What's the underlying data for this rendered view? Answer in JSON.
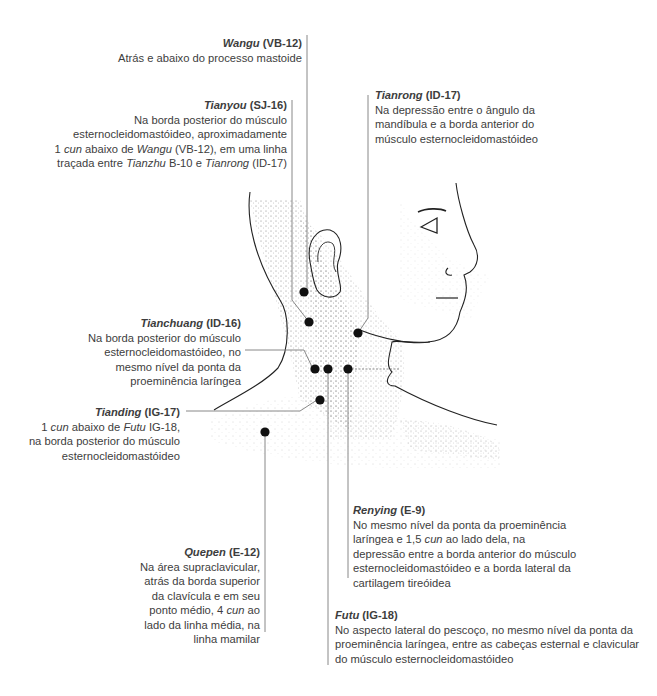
{
  "points": [
    {
      "id": "wangu",
      "name": "Wangu",
      "code": "(VB-12)",
      "lines": [
        [
          "Atrás e abaixo do processo mastoide"
        ]
      ]
    },
    {
      "id": "tianyou",
      "name": "Tianyou",
      "code": "(SJ-16)",
      "lines": [
        "Na borda posterior do músculo",
        "esternocleidomastóideo, aproximadamente",
        "1 |cun| abaixo de |Wangu| (VB-12), em uma linha",
        "traçada entre |Tianzhu| B-10 e |Tianrong| (ID-17)"
      ]
    },
    {
      "id": "tianrong",
      "name": "Tianrong",
      "code": "(ID-17)",
      "lines": [
        "Na depressão entre o ângulo da",
        "mandíbula e a borda anterior do",
        "músculo esternocleidomastóideo"
      ]
    },
    {
      "id": "tianchuang",
      "name": "Tianchuang",
      "code": "(ID-16)",
      "lines": [
        "Na borda posterior do músculo",
        "esternocleidomastóideo, no",
        "mesmo nível da ponta da",
        "proeminência laríngea"
      ]
    },
    {
      "id": "tianding",
      "name": "Tianding",
      "code": "(IG-17)",
      "lines": [
        "1 |cun| abaixo de |Futu| IG-18,",
        "na borda posterior do músculo",
        "esternocleidomastóideo"
      ]
    },
    {
      "id": "quepen",
      "name": "Quepen",
      "code": "(E-12)",
      "lines": [
        "Na área supraclavicular,",
        "atrás da borda superior",
        "da clavícula e em seu",
        "ponto médio, 4 |cun| ao",
        "lado da linha média, na",
        "linha mamilar"
      ]
    },
    {
      "id": "renying",
      "name": "Renying",
      "code": "(E-9)",
      "lines": [
        "No mesmo nível da ponta da proeminência",
        "laríngea e 1,5 |cun| ao lado dela, na",
        "depressão entre a borda anterior do músculo",
        "esternocleidomastóideo e a borda lateral da",
        "cartilagem tireóidea"
      ]
    },
    {
      "id": "futu",
      "name": "Futu",
      "code": "(IG-18)",
      "lines": [
        "No aspecto lateral do pescoço, no mesmo nível da ponta da",
        "proeminência laríngea, entre as cabeças esternal e clavicular",
        "do músculo esternocleidomastóideo"
      ]
    }
  ],
  "colors": {
    "text": "#3d3d3d",
    "leader": "#7a7a7a",
    "dot": "#111111",
    "outline": "#222222",
    "stipple": "#555555"
  }
}
